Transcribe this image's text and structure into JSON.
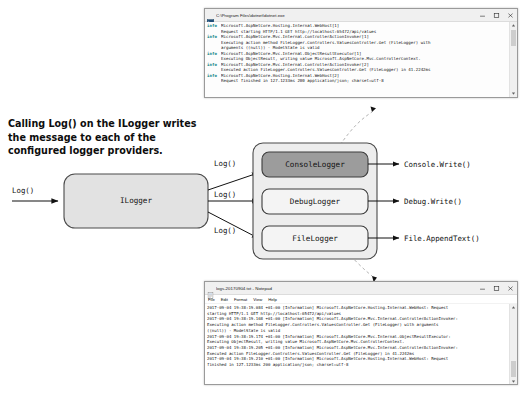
{
  "caption": {
    "text": "Calling Log() on the ILogger writes the message to each of the configured logger providers."
  },
  "diagram": {
    "input_label": "Log()",
    "ilogger_box": "ILogger",
    "branch_labels": [
      "Log()",
      "Log()",
      "Log()"
    ],
    "providers": [
      {
        "name": "ConsoleLogger",
        "output": "Console.Write()",
        "highlighted": true
      },
      {
        "name": "DebugLogger",
        "output": "Debug.Write()",
        "highlighted": false
      },
      {
        "name": "FileLogger",
        "output": "File.AppendText()",
        "highlighted": false
      }
    ],
    "colors": {
      "box_fill": "#e2e2e2",
      "box_stroke": "#4a4a4a",
      "highlight_fill": "#9c9c9c",
      "provider_fill": "#ededed",
      "arrow": "#111111",
      "dashed": "#b8b8b8"
    }
  },
  "console_window": {
    "icon": "terminal-icon",
    "title": "C:\\Program Files\\dotnet\\dotnet.exe",
    "buttons": {
      "minimize": "minimize-button",
      "maximize": "maximize-button",
      "close": "close-button"
    },
    "lines": [
      {
        "level": "info",
        "text": "Microsoft.AspNetCore.Hosting.Internal.WebHost[1]"
      },
      {
        "level": "",
        "text": "Request starting HTTP/1.1 GET http://localhost:65472/api/values"
      },
      {
        "level": "info",
        "text": "Microsoft.AspNetCore.Mvc.Internal.ControllerActionInvoker[1]"
      },
      {
        "level": "",
        "text": "Executing action method FileLogger.Controllers.ValuesController.Get (FileLogger) with"
      },
      {
        "level": "",
        "text": "arguments ((null)) - ModelState is valid"
      },
      {
        "level": "info",
        "text": "Microsoft.AspNetCore.Mvc.Internal.ObjectResultExecutor[1]"
      },
      {
        "level": "",
        "text": "Executing ObjectResult, writing value Microsoft.AspNetCore.Mvc.ControllerContext."
      },
      {
        "level": "info",
        "text": "Microsoft.AspNetCore.Mvc.Internal.ControllerActionInvoker[2]"
      },
      {
        "level": "",
        "text": "Executed action FileLogger.Controllers.ValuesController.Get (FileLogger) in 41.2242ms"
      },
      {
        "level": "info",
        "text": "Microsoft.AspNetCore.Hosting.Internal.WebHost[2]"
      },
      {
        "level": "",
        "text": "Request finished in 127.1233ms 200 application/json; charset=utf-8"
      }
    ]
  },
  "notepad_window": {
    "icon": "notepad-icon",
    "title": "logs-20170904.txt - Notepad",
    "menu": [
      "File",
      "Edit",
      "Format",
      "View",
      "Help"
    ],
    "buttons": {
      "minimize": "minimize-button",
      "maximize": "maximize-button",
      "close": "close-button"
    },
    "lines": [
      "2017-09-04 19:38:19.084 +01:00 [Information] Microsoft.AspNetCore.Hosting.Internal.WebHost: Request",
      "starting HTTP/1.1 GET http://localhost:65472/api/values",
      "2017-09-04 19:38:19.168 +01:00 [Information] Microsoft.AspNetCore.Mvc.Internal.ControllerActionInvoker:",
      "Executing action method FileLogger.Controllers.ValuesController.Get (FileLogger) with arguments",
      "((null)) - ModelState is valid",
      "2017-09-04 19:38:19.174 +01:00 [Information] Microsoft.AspNetCore.Mvc.Internal.ObjectResultExecutor:",
      "Executing ObjectResult, writing value Microsoft.AspNetCore.Mvc.ControllerContext.",
      "2017-09-04 19:38:19.205 +01:00 [Information] Microsoft.AspNetCore.Mvc.Internal.ControllerActionInvoker:",
      "Executed action FileLogger.Controllers.ValuesController.Get (FileLogger) in 41.2242ms",
      "2017-09-04 19:38:19.210 +01:00 [Information] Microsoft.AspNetCore.Hosting.Internal.WebHost: Request",
      "finished in 127.1233ms 200 application/json; charset=utf-8"
    ]
  }
}
